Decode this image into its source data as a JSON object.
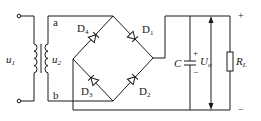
{
  "diagram": {
    "type": "bridge-rectifier-circuit",
    "labels": {
      "input_voltage": "u",
      "input_voltage_sub": "1",
      "secondary_voltage": "u",
      "secondary_voltage_sub": "2",
      "node_a": "a",
      "node_b": "b",
      "d1": "D",
      "d1_sub": "1",
      "d2": "D",
      "d2_sub": "2",
      "d3": "D",
      "d3_sub": "3",
      "d4": "D",
      "d4_sub": "4",
      "capacitor": "C",
      "capacitor_plus": "+",
      "capacitor_minus": "−",
      "output_voltage": "U",
      "output_voltage_sub": "o",
      "load": "R",
      "load_sub": "L",
      "output_plus": "+",
      "output_minus": "−"
    },
    "components": [
      "transformer",
      "D1",
      "D2",
      "D3",
      "D4",
      "C",
      "RL"
    ],
    "colors": {
      "line": "#1a1a1a",
      "background": "#ffffff"
    }
  }
}
